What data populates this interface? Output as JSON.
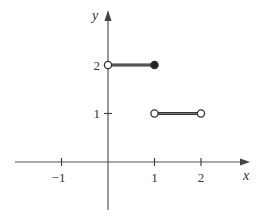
{
  "chart_data": {
    "type": "line",
    "title": "",
    "xlabel": "x",
    "ylabel": "y",
    "xlim": [
      -2,
      2.9
    ],
    "ylim": [
      -1,
      3.2
    ],
    "x_ticks": [
      -1,
      1,
      2
    ],
    "x_tick_labels": [
      "−1",
      "1",
      "2"
    ],
    "y_ticks": [
      1,
      2
    ],
    "y_tick_labels": [
      "1",
      "2"
    ],
    "grid": false,
    "legend": "none",
    "series": [
      {
        "name": "piece-1",
        "x": [
          0,
          1
        ],
        "y": [
          2,
          2
        ],
        "start": "open",
        "end": "closed"
      },
      {
        "name": "piece-2",
        "x": [
          1,
          2
        ],
        "y": [
          1,
          1
        ],
        "start": "open",
        "end": "open"
      }
    ]
  },
  "colors": {
    "axis": "#555555",
    "segment": "#333333",
    "text": "#333333"
  }
}
